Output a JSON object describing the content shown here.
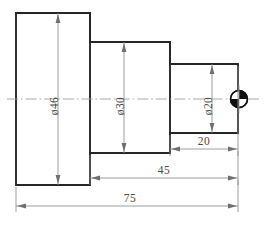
{
  "drawing": {
    "title": "Stepped shaft orthographic view",
    "type": "mechanical-part-drawing",
    "units": "mm",
    "canvas": {
      "width": 264,
      "height": 233,
      "background": "#ffffff"
    },
    "colors": {
      "outline": "#262626",
      "dimension": "#8c8c8c",
      "centerline": "#9a9a9a",
      "text": "#4a4a4a",
      "datum_fill": "#111111"
    },
    "steps": [
      {
        "name": "step-large",
        "diameter_label": "ø46",
        "diameter": 46,
        "x0": 16,
        "x1": 90,
        "y0": 13,
        "y1": 185
      },
      {
        "name": "step-middle",
        "diameter_label": "ø30",
        "diameter": 30,
        "x0": 90,
        "x1": 170,
        "y0": 42,
        "y1": 153
      },
      {
        "name": "step-small",
        "diameter_label": "ø20",
        "diameter": 20,
        "x0": 170,
        "x1": 238,
        "y0": 64,
        "y1": 133
      }
    ],
    "diameter_dimensions": [
      {
        "name": "diameter-46",
        "label": "ø46",
        "value": 46,
        "x": 58,
        "y_top": 13,
        "y_bottom": 185,
        "text_y": 106
      },
      {
        "name": "diameter-30",
        "label": "ø30",
        "value": 30,
        "x": 124,
        "y_top": 42,
        "y_bottom": 153,
        "text_y": 106
      },
      {
        "name": "diameter-20",
        "label": "ø20",
        "value": 20,
        "x": 212,
        "y_top": 64,
        "y_bottom": 133,
        "text_y": 106
      }
    ],
    "length_dimensions": [
      {
        "name": "length-20",
        "label": "20",
        "value": 20,
        "x0": 170,
        "x1": 238,
        "y": 149,
        "text_x": 204,
        "text_y": 145
      },
      {
        "name": "length-45",
        "label": "45",
        "value": 45,
        "x0": 90,
        "x1": 238,
        "y": 178,
        "text_x": 164,
        "text_y": 174
      },
      {
        "name": "length-75",
        "label": "75",
        "value": 75,
        "x0": 16,
        "x1": 238,
        "y": 206,
        "text_x": 130,
        "text_y": 202
      }
    ],
    "centerline": {
      "name": "axis-centerline",
      "y": 99,
      "x0": 7,
      "x1": 259
    },
    "datum_marker": {
      "name": "datum-target-symbol",
      "cx": 239,
      "cy": 99,
      "r": 9,
      "filled_quadrants": "upper-right,lower-left"
    }
  }
}
